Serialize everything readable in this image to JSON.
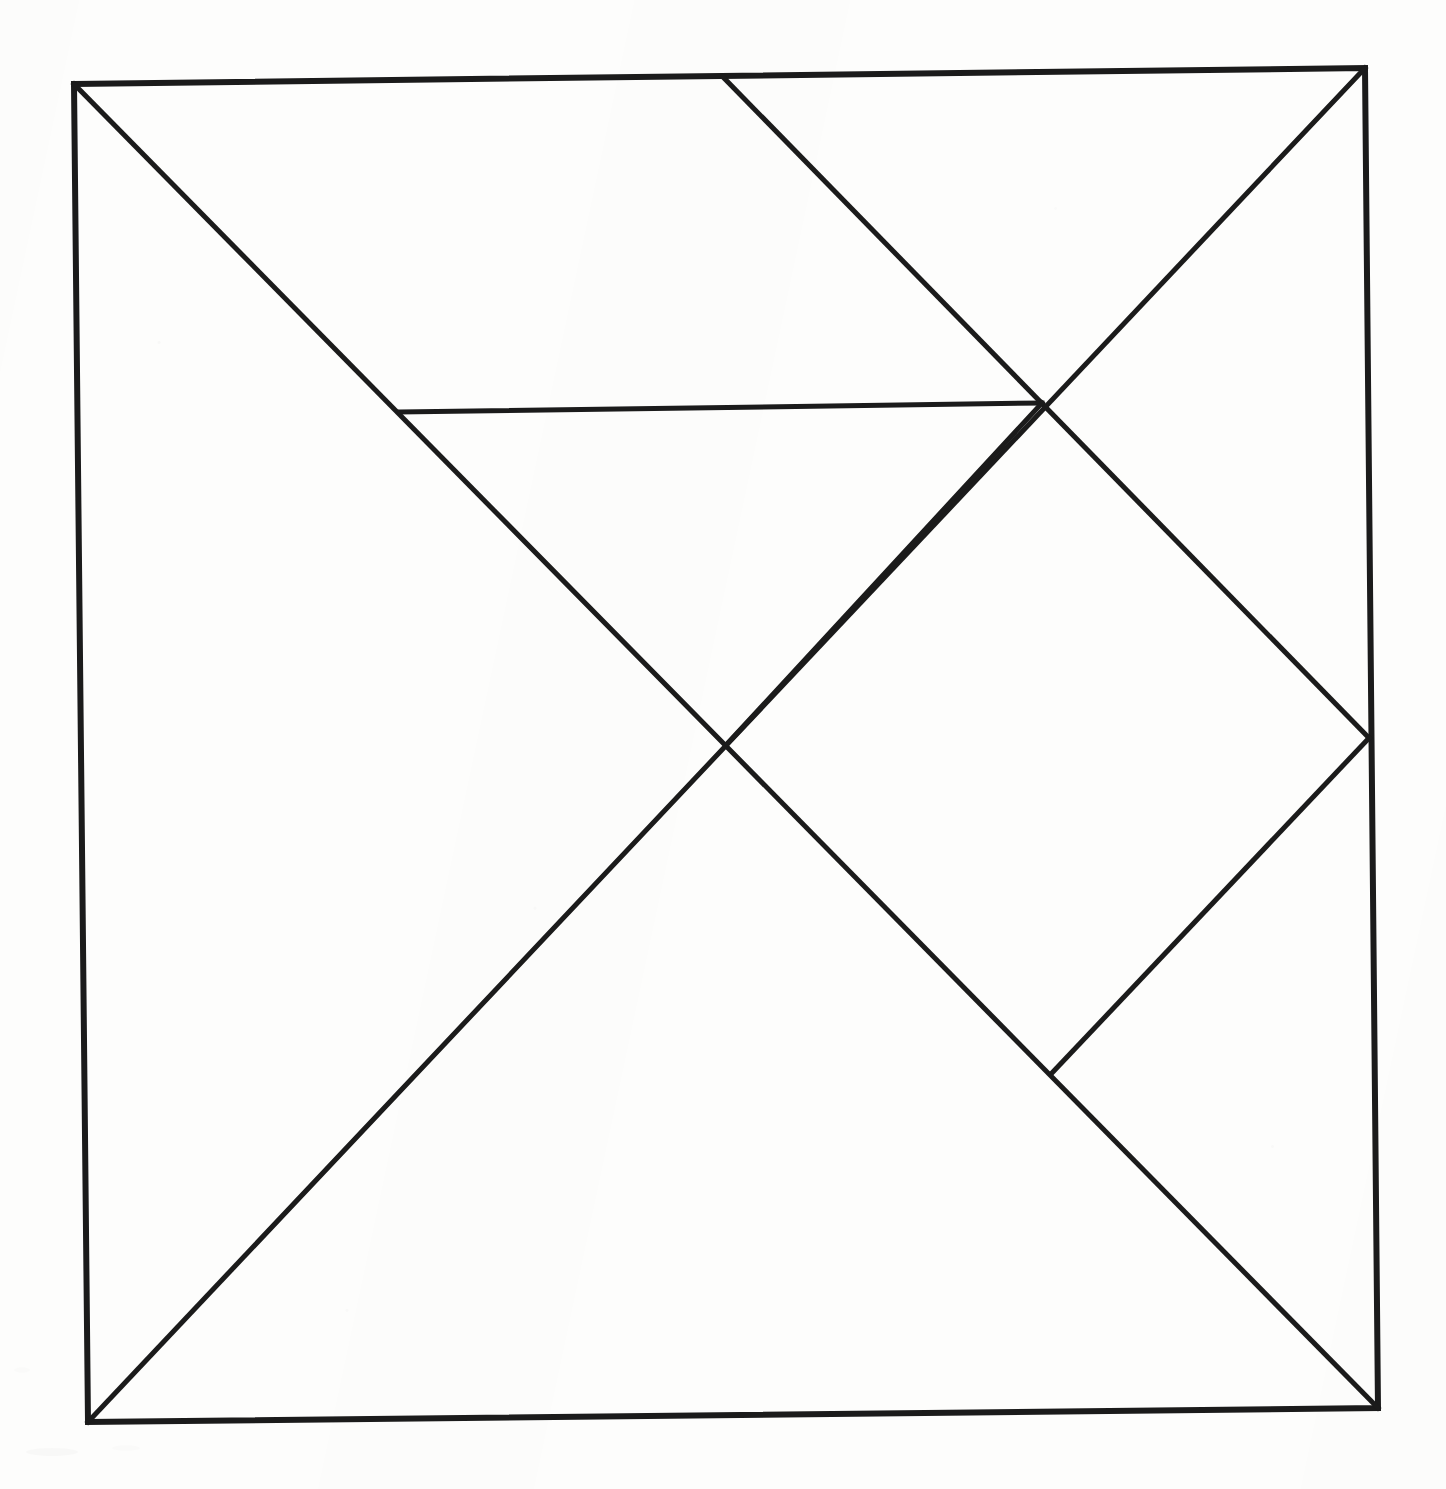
{
  "figure": {
    "background_color": "#fdfdfc",
    "ink_color": "#1b1b1b",
    "canvas": {
      "width": 1446,
      "height": 1489
    },
    "stroke_widths": {
      "outer_border": 6,
      "interior": 5
    }
  },
  "geometry": {
    "points": {
      "square_top_left": {
        "x": 74,
        "y": 84
      },
      "square_top_right": {
        "x": 1365,
        "y": 68
      },
      "square_bottom_right": {
        "x": 1378,
        "y": 1408
      },
      "square_bottom_left": {
        "x": 88,
        "y": 1422
      },
      "center_crossing": {
        "x": 727,
        "y": 744
      },
      "top_edge_branch": {
        "x": 723,
        "y": 77
      },
      "diamond_top": {
        "x": 1042,
        "y": 403
      },
      "diamond_right": {
        "x": 1369,
        "y": 738
      },
      "diamond_bottom": {
        "x": 1052,
        "y": 1073
      },
      "chord_left_end": {
        "x": 400,
        "y": 412
      }
    },
    "outer_square_path": "74,84 1365,68 1378,1408 88,1422",
    "lines": [
      {
        "name": "main-diagonal-tl-br",
        "from": "square_top_left",
        "to": "square_bottom_right",
        "d": "M 74 84 L 1378 1408"
      },
      {
        "name": "main-diagonal-bl-tr",
        "from": "square_bottom_left",
        "to": "square_top_right",
        "d": "M 88 1422 L 1365 68"
      },
      {
        "name": "secondary-diagonal-top-to-right",
        "from": "top_edge_branch",
        "to": "diamond_right",
        "d": "M 723 77 L 1369 738"
      },
      {
        "name": "horizontal-chord",
        "from": "chord_left_end",
        "to": "diamond_top",
        "d": "M 400 412 L 1042 403"
      },
      {
        "name": "diamond-edge-center-to-top",
        "from": "center_crossing",
        "to": "diamond_top",
        "d": "M 727 744 L 1042 403"
      },
      {
        "name": "diamond-edge-right-to-bottom",
        "from": "diamond_right",
        "to": "diamond_bottom",
        "d": "M 1369 738 L 1052 1073"
      }
    ],
    "inscribed_diamond": {
      "name": "inscribed-rotated-square",
      "vertices": [
        "center_crossing",
        "diamond_top",
        "diamond_right",
        "diamond_bottom"
      ],
      "points": "727,744 1042,403 1369,738 1052,1073"
    }
  },
  "chart_data": {
    "type": "diagram",
    "xlabel": "",
    "ylabel": "",
    "grid": false,
    "legend": null,
    "vertices": [
      {
        "label": "square_top_left",
        "x": 74,
        "y": 84
      },
      {
        "label": "square_top_right",
        "x": 1365,
        "y": 68
      },
      {
        "label": "square_bottom_right",
        "x": 1378,
        "y": 1408
      },
      {
        "label": "square_bottom_left",
        "x": 88,
        "y": 1422
      },
      {
        "label": "center_crossing",
        "x": 727,
        "y": 744
      },
      {
        "label": "top_edge_branch",
        "x": 723,
        "y": 77
      },
      {
        "label": "diamond_top",
        "x": 1042,
        "y": 403
      },
      {
        "label": "diamond_right",
        "x": 1369,
        "y": 738
      },
      {
        "label": "diamond_bottom",
        "x": 1052,
        "y": 1073
      },
      {
        "label": "chord_left_end",
        "x": 400,
        "y": 412
      }
    ],
    "segments": [
      [
        "square_top_left",
        "square_top_right"
      ],
      [
        "square_top_right",
        "square_bottom_right"
      ],
      [
        "square_bottom_right",
        "square_bottom_left"
      ],
      [
        "square_bottom_left",
        "square_top_left"
      ],
      [
        "square_top_left",
        "square_bottom_right"
      ],
      [
        "square_bottom_left",
        "square_top_right"
      ],
      [
        "top_edge_branch",
        "diamond_right"
      ],
      [
        "chord_left_end",
        "diamond_top"
      ],
      [
        "center_crossing",
        "diamond_top"
      ],
      [
        "diamond_right",
        "diamond_bottom"
      ]
    ],
    "pieces_count": 7
  }
}
